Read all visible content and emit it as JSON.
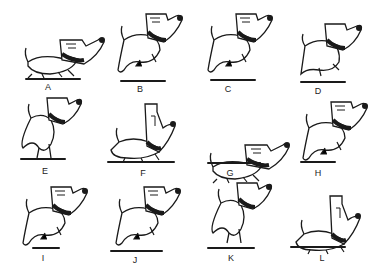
{
  "figure": {
    "frames": [
      {
        "label": "A",
        "pose": "crouch",
        "x": 20,
        "y": 10,
        "lx": 48,
        "ly": 82,
        "gx": 25,
        "gy": 78,
        "gw": 56,
        "shadow": false
      },
      {
        "label": "B",
        "pose": "leap",
        "x": 110,
        "y": 10,
        "lx": 140,
        "ly": 84,
        "gx": 120,
        "gy": 80,
        "gw": 46,
        "shadow": true
      },
      {
        "label": "C",
        "pose": "leap",
        "x": 200,
        "y": 10,
        "lx": 228,
        "ly": 84,
        "gx": 210,
        "gy": 79,
        "gw": 46,
        "shadow": true
      },
      {
        "label": "D",
        "pose": "land",
        "x": 295,
        "y": 10,
        "lx": 318,
        "ly": 86,
        "gx": 300,
        "gy": 81,
        "gw": 46,
        "shadow": false
      },
      {
        "label": "E",
        "pose": "rear",
        "x": 15,
        "y": 98,
        "lx": 45,
        "ly": 166,
        "gx": 20,
        "gy": 158,
        "gw": 46,
        "shadow": false
      },
      {
        "label": "F",
        "pose": "sniff",
        "x": 105,
        "y": 98,
        "lx": 143,
        "ly": 168,
        "gx": 107,
        "gy": 161,
        "gw": 68,
        "shadow": false
      },
      {
        "label": "G",
        "pose": "crouch",
        "x": 205,
        "y": 115,
        "lx": 230,
        "ly": 168,
        "gx": 207,
        "gy": 162,
        "gw": 54,
        "shadow": false
      },
      {
        "label": "H",
        "pose": "leap",
        "x": 295,
        "y": 98,
        "lx": 318,
        "ly": 168,
        "gx": 300,
        "gy": 161,
        "gw": 36,
        "shadow": true
      },
      {
        "label": "I",
        "pose": "leap",
        "x": 15,
        "y": 183,
        "lx": 43,
        "ly": 253,
        "gx": 32,
        "gy": 247,
        "gw": 28,
        "shadow": true
      },
      {
        "label": "J",
        "pose": "leap",
        "x": 108,
        "y": 183,
        "lx": 135,
        "ly": 255,
        "gx": 110,
        "gy": 250,
        "gw": 53,
        "shadow": true
      },
      {
        "label": "K",
        "pose": "rear",
        "x": 205,
        "y": 183,
        "lx": 231,
        "ly": 253,
        "gx": 207,
        "gy": 247,
        "gw": 48,
        "shadow": false
      },
      {
        "label": "L",
        "pose": "sniff",
        "x": 290,
        "y": 190,
        "lx": 322,
        "ly": 253,
        "gx": 290,
        "gy": 246,
        "gw": 56,
        "shadow": false
      }
    ]
  },
  "colors": {
    "ink": "#1a1a1a",
    "background": "#ffffff"
  }
}
